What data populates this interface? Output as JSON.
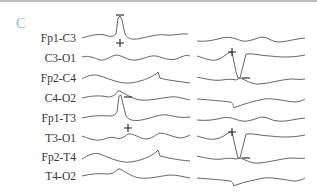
{
  "figure": {
    "panel_label": "C",
    "channels": [
      {
        "label": "Fp1-C3"
      },
      {
        "label": "C3-O1"
      },
      {
        "label": "Fp2-C4"
      },
      {
        "label": "C4-O2"
      },
      {
        "label": "Fp1-T3"
      },
      {
        "label": "T3-O1"
      },
      {
        "label": "Fp2-T4"
      },
      {
        "label": "T4-O2"
      }
    ],
    "polarity_marks": {
      "left_panel": [
        {
          "channel": "Fp1-C3",
          "symbol_top": "−",
          "symbol_bottom": "+"
        },
        {
          "channel": "Fp1-T3",
          "symbol_top": "−",
          "symbol_bottom": "+"
        }
      ],
      "right_panel": [
        {
          "channel": "C3-O1 / Fp2-C4",
          "symbol_top": "+",
          "symbol_bottom": "−"
        },
        {
          "channel": "T3-O1 / Fp2-T4",
          "symbol_top": "+",
          "symbol_bottom": "−"
        }
      ]
    },
    "trace_color": "#666666",
    "panel_label_color": "#8fb4d6"
  }
}
